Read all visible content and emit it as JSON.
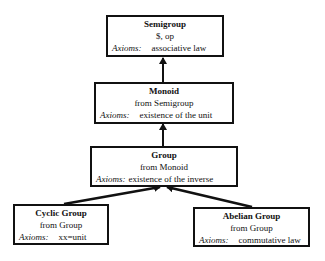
{
  "diagram": {
    "type": "inheritance-hierarchy",
    "nodes": [
      {
        "id": "semigroup",
        "title": "Semigroup",
        "subtitle": "$, op",
        "axioms_label": "Axioms:",
        "axioms": "associative law"
      },
      {
        "id": "monoid",
        "title": "Monoid",
        "subtitle": "from Semigroup",
        "axioms_label": "Axioms:",
        "axioms": "existence of the unit"
      },
      {
        "id": "group",
        "title": "Group",
        "subtitle": "from Monoid",
        "axioms_label": "Axioms:",
        "axioms": "existence of the inverse"
      },
      {
        "id": "cyclic",
        "title": "Cyclic Group",
        "subtitle": "from Group",
        "axioms_label": "Axioms:",
        "axioms": "xx=unit"
      },
      {
        "id": "abelian",
        "title": "Abelian Group",
        "subtitle": "from Group",
        "axioms_label": "Axioms:",
        "axioms": "commutative law"
      }
    ],
    "edges": [
      {
        "from": "monoid",
        "to": "semigroup"
      },
      {
        "from": "group",
        "to": "monoid"
      },
      {
        "from": "cyclic",
        "to": "group"
      },
      {
        "from": "abelian",
        "to": "group"
      }
    ],
    "colors": {
      "line": "#111111",
      "background": "#ffffff"
    }
  }
}
